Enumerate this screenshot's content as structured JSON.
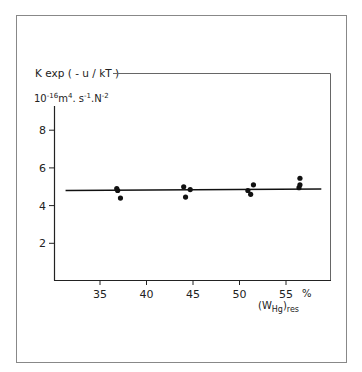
{
  "chart_data": {
    "type": "scatter",
    "title": "",
    "ylabel": "K exp(-u/kT)",
    "ylabel_units": "10^-16 m^4.s^-1.N^-2",
    "ylabel_line1": "K exp ( - u / kT )",
    "ylabel_line2_base": "10",
    "ylabel_line2_exp": "-16",
    "ylabel_line2_rest": [
      {
        "t": "m",
        "sup": "4"
      },
      {
        "t": ". s",
        "sup": "-1"
      },
      {
        "t": ".N",
        "sup": "-2"
      }
    ],
    "xlabel": "(W_Hg)_res",
    "xlabel_main": "(W",
    "xlabel_sub1": "Hg",
    "xlabel_paren": ")",
    "xlabel_sub2": "res",
    "x_unit": "%",
    "xlim": [
      31,
      59
    ],
    "ylim": [
      0,
      9
    ],
    "x_ticks": [
      35,
      40,
      45,
      50,
      55
    ],
    "y_ticks": [
      2,
      4,
      6,
      8
    ],
    "grid": false,
    "legend": null,
    "series": [
      {
        "name": "measurements",
        "kind": "points",
        "points": [
          {
            "x": 36.8,
            "y": 4.9
          },
          {
            "x": 36.9,
            "y": 4.8
          },
          {
            "x": 37.2,
            "y": 4.4
          },
          {
            "x": 44.0,
            "y": 5.0
          },
          {
            "x": 44.2,
            "y": 4.45
          },
          {
            "x": 44.7,
            "y": 4.85
          },
          {
            "x": 50.9,
            "y": 4.8
          },
          {
            "x": 51.2,
            "y": 4.6
          },
          {
            "x": 51.5,
            "y": 5.1
          },
          {
            "x": 56.5,
            "y": 5.45
          },
          {
            "x": 56.5,
            "y": 5.1
          },
          {
            "x": 56.4,
            "y": 4.95
          }
        ]
      },
      {
        "name": "fit line",
        "kind": "line",
        "points": [
          {
            "x": 31.3,
            "y": 4.8
          },
          {
            "x": 58.8,
            "y": 4.88
          }
        ]
      }
    ]
  },
  "colors": {
    "ink": "#111111",
    "frame": "#888888",
    "background": "#ffffff"
  }
}
